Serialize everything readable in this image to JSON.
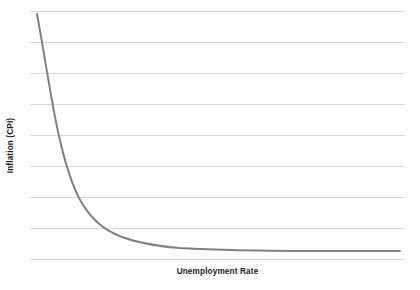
{
  "chart_data": {
    "type": "line",
    "title": "",
    "subtitle": "",
    "xlabel": "Unemployment Rate",
    "ylabel": "Inflation (CPI)",
    "series": [
      {
        "name": "Phillips Curve",
        "color": "#808080",
        "line_width": 2,
        "points": [
          {
            "x": 0.02,
            "y": 9.62
          },
          {
            "x": 0.05,
            "y": 8.55
          },
          {
            "x": 0.08,
            "y": 7.6
          },
          {
            "x": 0.11,
            "y": 6.75
          },
          {
            "x": 0.14,
            "y": 6.0
          },
          {
            "x": 0.17,
            "y": 5.35
          },
          {
            "x": 0.2,
            "y": 4.78
          },
          {
            "x": 0.24,
            "y": 4.12
          },
          {
            "x": 0.28,
            "y": 3.58
          },
          {
            "x": 0.32,
            "y": 3.12
          },
          {
            "x": 0.36,
            "y": 2.74
          },
          {
            "x": 0.4,
            "y": 2.42
          },
          {
            "x": 0.45,
            "y": 2.1
          },
          {
            "x": 0.5,
            "y": 1.84
          },
          {
            "x": 0.55,
            "y": 1.63
          },
          {
            "x": 0.6,
            "y": 1.46
          },
          {
            "x": 0.66,
            "y": 1.3
          },
          {
            "x": 0.72,
            "y": 1.17
          },
          {
            "x": 0.78,
            "y": 1.07
          },
          {
            "x": 0.85,
            "y": 0.97
          },
          {
            "x": 0.92,
            "y": 0.89
          },
          {
            "x": 1.0,
            "y": 0.82
          }
        ]
      }
    ],
    "xlim": [
      0,
      1
    ],
    "ylim": [
      0,
      10
    ],
    "xticks": [],
    "yticks": [],
    "xtick_labels": [],
    "ytick_labels": [],
    "grid": {
      "horizontal": true,
      "vertical": false,
      "count": 9,
      "color": "#d8d8d8",
      "line_width": 1,
      "y_values": [
        10,
        8.75,
        7.5,
        6.25,
        5,
        3.75,
        2.5,
        1.25,
        0
      ]
    },
    "legend": {
      "visible": false,
      "position": "none"
    },
    "annotations": [],
    "background_color": "#ffffff",
    "axis_title_color": "#1a1a1a"
  },
  "plot_geometry": {
    "left": 30,
    "right": 405,
    "top": 11,
    "bottom": 259,
    "curve_path": "M 37,14 C 44,52 50,92 56,122 C 62,152 70,180 79,198 C 88,215 100,227 115,234 C 132,242 155,246 180,248 C 215,250 260,251 310,251 C 345,251 375,251 400,251"
  }
}
